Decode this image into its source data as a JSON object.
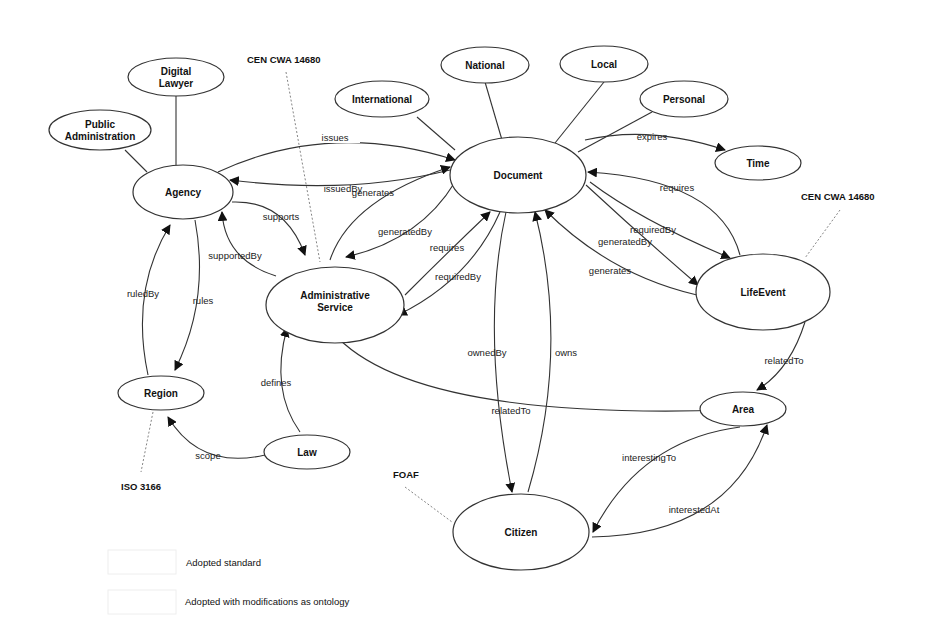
{
  "nodes": {
    "public_administration": [
      "Public",
      "Administration"
    ],
    "digital_lawyer": [
      "Digital",
      "Lawyer"
    ],
    "agency": "Agency",
    "international": "International",
    "national": "National",
    "local": "Local",
    "personal": "Personal",
    "document": "Document",
    "time": "Time",
    "administrative_service": [
      "Administrative",
      "Service"
    ],
    "lifeevent": "LifeEvent",
    "region": "Region",
    "law": "Law",
    "area": "Area",
    "citizen": "Citizen"
  },
  "edges": {
    "issues": "issues",
    "issuedBy": "issuedBy",
    "generates_doc": "generates",
    "supports": "supports",
    "supportedBy": "supportedBy",
    "generatedBy_as": "generatedBy",
    "requires_as": "requires",
    "requiredBy_as": "requiredBy",
    "ruledBy": "ruledBy",
    "rules": "rules",
    "defines": "defines",
    "scope": "scope",
    "expires": "expires",
    "requires_le": "requires",
    "requiredBy_le": "requiredBy",
    "generatedBy_le": "generatedBy",
    "generates_le": "generates",
    "ownedBy": "ownedBy",
    "owns": "owns",
    "relatedTo_as": "relatedTo",
    "relatedTo_le": "relatedTo",
    "interestingTo": "interestingTo",
    "interestedAt": "interestedAt"
  },
  "standards": {
    "cen_top": "CEN CWA 14680",
    "cen_right": "CEN CWA 14680",
    "iso": "ISO 3166",
    "foaf": "FOAF"
  },
  "legend": {
    "adopted_standard": "Adopted standard",
    "adopted_modified": "Adopted with modifications as ontology"
  }
}
